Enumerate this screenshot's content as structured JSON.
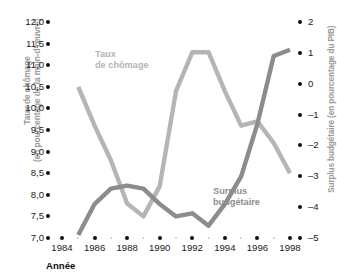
{
  "chart_data": {
    "type": "line",
    "title": "",
    "xlabel": "Année",
    "x": [
      1984,
      1985,
      1986,
      1987,
      1988,
      1989,
      1990,
      1991,
      1992,
      1993,
      1994,
      1995,
      1996,
      1997,
      1998
    ],
    "xticks": [
      "1984",
      "1986",
      "1988",
      "1990",
      "1992",
      "1994",
      "1996",
      "1998"
    ],
    "grid": false,
    "legend_position": "inline-annotations",
    "axes": [
      {
        "id": "left",
        "label_line1": "Taux de chômage",
        "label_line2": "(en pourcentage de la main-d'œuvre)",
        "ticks": [
          "12,0",
          "11,5",
          "11,0",
          "10,5",
          "10,0",
          "9,5",
          "9,0",
          "8,5",
          "8,0",
          "7,5",
          "7,0"
        ],
        "ylim": [
          7.0,
          12.0
        ]
      },
      {
        "id": "right",
        "label": "Surplus budgétaire (en pourcentage du PIB)",
        "ticks": [
          "2",
          "1",
          "0",
          "-1",
          "-2",
          "-3",
          "-4",
          "-5"
        ],
        "ylim": [
          -5,
          2
        ]
      }
    ],
    "series": [
      {
        "name": "Taux de chômage",
        "axis": "left",
        "color": "#b5b5b5",
        "x": [
          1985,
          1986,
          1987,
          1988,
          1989,
          1990,
          1991,
          1992,
          1993,
          1994,
          1995,
          1996,
          1997,
          1998
        ],
        "values": [
          10.5,
          9.6,
          8.8,
          7.8,
          7.5,
          8.2,
          10.4,
          11.3,
          11.3,
          10.4,
          9.6,
          9.7,
          9.2,
          8.5
        ]
      },
      {
        "name": "Surplus budgétaire",
        "axis": "right",
        "color": "#8c8c8c",
        "x": [
          1985,
          1986,
          1987,
          1988,
          1989,
          1990,
          1991,
          1992,
          1993,
          1994,
          1995,
          1996,
          1997,
          1998
        ],
        "values": [
          -4.9,
          -3.9,
          -3.4,
          -3.3,
          -3.4,
          -3.9,
          -4.3,
          -4.2,
          -4.6,
          -3.9,
          -3.0,
          -1.3,
          0.9,
          1.1
        ]
      }
    ],
    "annotations": [
      {
        "name": "Taux de chômage",
        "line1": "Taux",
        "line2": "de chômage"
      },
      {
        "name": "Surplus budgétaire",
        "line1": "Surplus",
        "line2": "budgétaire"
      }
    ]
  }
}
